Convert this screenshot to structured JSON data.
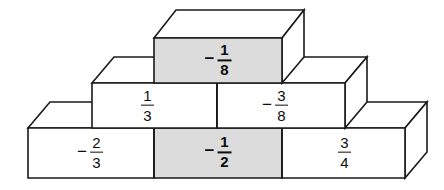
{
  "figure": {
    "colors": {
      "outline": "#1a1a1a",
      "face_white": "#ffffff",
      "face_shaded": "#dcdcdc",
      "background": "#ffffff",
      "text": "#0d0d0d"
    },
    "rows": [
      {
        "name": "top-row",
        "blocks": [
          {
            "id": "block-top-1",
            "sign": "−",
            "numerator": "1",
            "denominator": "8",
            "value": "-1/8",
            "shaded": true,
            "bold": true
          }
        ]
      },
      {
        "name": "middle-row",
        "blocks": [
          {
            "id": "block-middle-1",
            "sign": "",
            "numerator": "1",
            "denominator": "3",
            "value": "1/3",
            "shaded": false,
            "bold": false
          },
          {
            "id": "block-middle-2",
            "sign": "−",
            "numerator": "3",
            "denominator": "8",
            "value": "-3/8",
            "shaded": false,
            "bold": false
          }
        ]
      },
      {
        "name": "bottom-row",
        "blocks": [
          {
            "id": "block-bottom-1",
            "sign": "−",
            "numerator": "2",
            "denominator": "3",
            "value": "-2/3",
            "shaded": false,
            "bold": false
          },
          {
            "id": "block-bottom-2",
            "sign": "−",
            "numerator": "1",
            "denominator": "2",
            "value": "-1/2",
            "shaded": true,
            "bold": true
          },
          {
            "id": "block-bottom-3",
            "sign": "",
            "numerator": "3",
            "denominator": "4",
            "value": "3/4",
            "shaded": false,
            "bold": false
          }
        ]
      }
    ],
    "labels": [
      {
        "id": "label-top-1",
        "sign": "−",
        "num": "1",
        "den": "8",
        "x": 218,
        "y": 60,
        "bold": true
      },
      {
        "id": "label-middle-1",
        "sign": "",
        "num": "1",
        "den": "3",
        "x": 146,
        "y": 105,
        "bold": false
      },
      {
        "id": "label-middle-2",
        "sign": "−",
        "num": "3",
        "den": "8",
        "x": 275,
        "y": 105,
        "bold": false
      },
      {
        "id": "label-bottom-1",
        "sign": "−",
        "num": "2",
        "den": "3",
        "x": 90,
        "y": 152,
        "bold": false
      },
      {
        "id": "label-bottom-2",
        "sign": "−",
        "num": "1",
        "den": "2",
        "x": 218,
        "y": 152,
        "bold": true
      },
      {
        "id": "label-bottom-3",
        "sign": "",
        "num": "3",
        "den": "4",
        "x": 343,
        "y": 152,
        "bold": false
      }
    ]
  }
}
